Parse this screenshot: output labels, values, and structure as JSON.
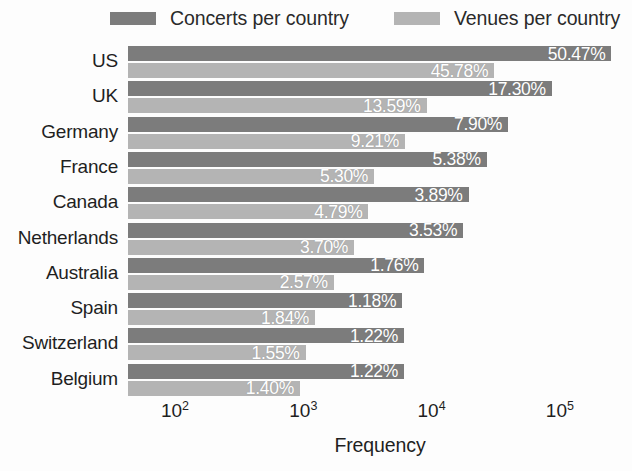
{
  "legend": {
    "position": "top",
    "entries": [
      {
        "label": "Concerts per country",
        "color": "#7c7c7c",
        "swatch_name": "legend-swatch-concerts"
      },
      {
        "label": "Venues per country",
        "color": "#b4b4b4",
        "swatch_name": "legend-swatch-venues"
      }
    ]
  },
  "axes": {
    "xlabel": "Frequency",
    "xticks": [
      {
        "base": "10",
        "exp": "2"
      },
      {
        "base": "10",
        "exp": "3"
      },
      {
        "base": "10",
        "exp": "4"
      },
      {
        "base": "10",
        "exp": "5"
      }
    ],
    "ylabel": ""
  },
  "chart_data": {
    "type": "bar",
    "orientation": "horizontal",
    "title": "",
    "xlabel": "Frequency",
    "ylabel": "",
    "xscale": "log",
    "xlim": [
      43,
      316228
    ],
    "xticks": [
      100,
      1000,
      10000,
      100000
    ],
    "xtick_labels": [
      "10^2",
      "10^3",
      "10^4",
      "10^5"
    ],
    "grid": false,
    "legend_position": "top",
    "categories": [
      "US",
      "UK",
      "Germany",
      "France",
      "Canada",
      "Netherlands",
      "Australia",
      "Spain",
      "Switzerland",
      "Belgium"
    ],
    "series": [
      {
        "name": "Concerts per country",
        "color": "#7c7c7c",
        "unit": "%",
        "values": [
          50.47,
          17.3,
          7.9,
          5.38,
          3.89,
          3.53,
          1.76,
          1.18,
          1.22,
          1.22
        ],
        "labels": [
          "50.47%",
          "17.30%",
          "7.90%",
          "5.38%",
          "3.89%",
          "3.53%",
          "1.76%",
          "1.18%",
          "1.22%",
          "1.22%"
        ],
        "frequencies": [
          252000,
          86400,
          39450,
          26870,
          19430,
          17630,
          8790,
          5893,
          6093,
          6093
        ]
      },
      {
        "name": "Venues per country",
        "color": "#b4b4b4",
        "unit": "%",
        "values": [
          45.78,
          13.59,
          9.21,
          5.3,
          4.79,
          3.7,
          2.57,
          1.84,
          1.55,
          1.4
        ],
        "labels": [
          "45.78%",
          "13.59%",
          "9.21%",
          "5.30%",
          "4.79%",
          "3.70%",
          "2.57%",
          "1.84%",
          "1.55%",
          "1.40%"
        ],
        "frequencies": [
          30760,
          9132,
          6189,
          3562,
          3219,
          2487,
          1727,
          1236,
          1042,
          941
        ]
      }
    ]
  },
  "render": {
    "plot_left_px": 128,
    "plot_width_px": 504,
    "plot_top_px": 44,
    "group_pitch_px": 35.3,
    "bar_height_px": 15,
    "bar_gap_px": 2,
    "x_min_freq": 43,
    "px_per_decade": 128.3,
    "tick_px": [
      47,
      175.3,
      303.6,
      431.9
    ]
  }
}
